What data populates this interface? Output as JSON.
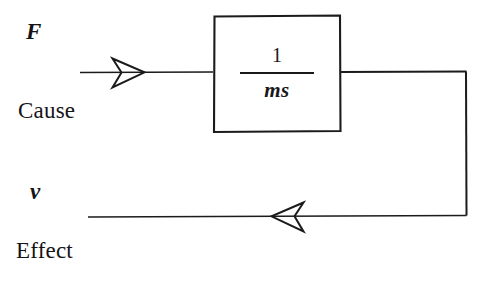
{
  "figure": {
    "kind": "control-block-diagram",
    "background_color": "#ffffff",
    "ink_color": "#18181a"
  },
  "labels": {
    "input_variable": "F",
    "input_role": "Cause",
    "output_variable": "v",
    "output_role": "Effect"
  },
  "block": {
    "transfer_function": {
      "numerator": "1",
      "denominator": "ms"
    }
  },
  "signals": {
    "forward_arrow": "arrow-right-open",
    "feedback_arrow": "arrow-left-open"
  }
}
